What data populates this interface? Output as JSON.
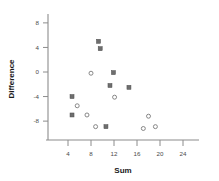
{
  "chart_data": {
    "type": "scatter",
    "title": "",
    "xlabel": "Sum",
    "ylabel": "Difference",
    "xlim": [
      1.5,
      26
    ],
    "ylim": [
      -11,
      10.5
    ],
    "xticks": [
      4,
      8,
      12,
      16,
      20,
      24
    ],
    "xticklabels": [
      "4",
      "8",
      "12",
      "16",
      "20",
      "24"
    ],
    "yticks": [
      8,
      4,
      0,
      -4,
      -8
    ],
    "yticklabels": [
      "8",
      "4",
      "0",
      "-4",
      "-8"
    ],
    "grid": false,
    "legend": "none",
    "series": [
      {
        "name": "filled-square",
        "marker": "square",
        "color": "#6e6e6e",
        "points": [
          {
            "x": 9.3,
            "y": 5.0
          },
          {
            "x": 9.6,
            "y": 3.8
          },
          {
            "x": 11.9,
            "y": -0.1
          },
          {
            "x": 11.3,
            "y": -2.2
          },
          {
            "x": 14.6,
            "y": -2.5
          },
          {
            "x": 4.7,
            "y": -4.0
          },
          {
            "x": 4.7,
            "y": -7.0
          },
          {
            "x": 10.6,
            "y": -8.9
          }
        ]
      },
      {
        "name": "open-circle",
        "marker": "circle",
        "color": "#7a7a7a",
        "points": [
          {
            "x": 8.0,
            "y": -0.2
          },
          {
            "x": 12.1,
            "y": -4.1
          },
          {
            "x": 5.6,
            "y": -5.5
          },
          {
            "x": 7.3,
            "y": -7.0
          },
          {
            "x": 8.8,
            "y": -8.9
          },
          {
            "x": 17.1,
            "y": -9.2
          },
          {
            "x": 18.0,
            "y": -7.2
          },
          {
            "x": 19.2,
            "y": -8.9
          }
        ]
      }
    ]
  },
  "axes": {
    "x_title": "Sum",
    "y_title": "Difference"
  }
}
